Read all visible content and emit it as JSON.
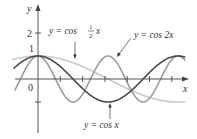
{
  "chart_data": {
    "type": "line",
    "title": "",
    "xlabel": "x",
    "ylabel": "y",
    "xlim": [
      -1.05,
      6.65
    ],
    "ylim": [
      -2.2,
      3.0
    ],
    "grid": false,
    "legend": "inline annotations with arrows",
    "x_ticks": [
      1,
      2,
      3,
      4,
      5,
      6
    ],
    "y_ticks": [
      -1,
      1,
      2
    ],
    "tick_labels": {
      "origin": "0",
      "y1": "1",
      "y2": "2"
    },
    "series": [
      {
        "name": "y = cos x",
        "expr": "cos(x)",
        "color": "#4a4a4a",
        "x_range": [
          -1.1,
          6.6
        ]
      },
      {
        "name": "y = cos 2x",
        "expr": "cos(2x)",
        "color": "#9a9a9a",
        "x_range": [
          -1.05,
          6.6
        ]
      },
      {
        "name": "y = cos ½ x",
        "expr": "cos(x/2)",
        "color": "#c8c8c8",
        "x_range": [
          -1.15,
          6.6
        ]
      }
    ],
    "annotations": [
      {
        "text_pre": "y = cos ",
        "frac_num": "1",
        "frac_den": "2",
        "text_post": "x",
        "target": "y = cos ½ x"
      },
      {
        "text": "y = cos 2x",
        "target": "y = cos 2x"
      },
      {
        "text": "y = cos x",
        "target": "y = cos x"
      }
    ]
  },
  "labels": {
    "y_axis": "y",
    "x_axis": "x",
    "origin": "0",
    "tick_1": "1",
    "tick_2": "2",
    "ann_half_pre": "y = cos",
    "ann_half_num": "1",
    "ann_half_den": "2",
    "ann_half_post": "x",
    "ann_2x_pre": "y = cos 2",
    "ann_2x_post": "x",
    "ann_x_pre": "y = cos",
    "ann_x_post": "x"
  }
}
